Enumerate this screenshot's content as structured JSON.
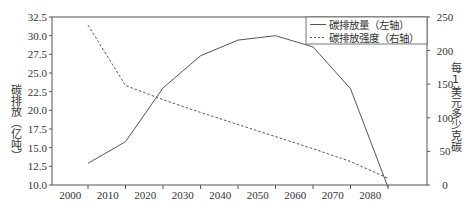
{
  "chart_data": {
    "type": "line",
    "title": "",
    "x": [
      2005,
      2015,
      2025,
      2035,
      2045,
      2055,
      2065,
      2075,
      2085
    ],
    "xlabel": "",
    "x_ticks": [
      "2000",
      "2010",
      "2020",
      "2030",
      "2040",
      "2050",
      "2060",
      "2070",
      "2080"
    ],
    "xlim": [
      1995,
      2095
    ],
    "y_left": {
      "label": "碳排放（亿吨）",
      "range": [
        10.0,
        32.5
      ],
      "ticks": [
        "10.0",
        "12.5",
        "15.0",
        "17.5",
        "20.0",
        "22.5",
        "25.0",
        "27.5",
        "30.0",
        "32.5"
      ]
    },
    "y_right": {
      "label": "每1美元多少克碳",
      "range": [
        0,
        250
      ],
      "ticks": [
        "0",
        "50",
        "100",
        "150",
        "200",
        "250"
      ]
    },
    "series": [
      {
        "name": "碳排放量（左轴）",
        "axis": "left",
        "style": "solid",
        "values": [
          12.9,
          15.8,
          23.0,
          27.3,
          29.4,
          30.0,
          28.5,
          22.9,
          9.7
        ]
      },
      {
        "name": "碳排放强度（右轴）",
        "axis": "right",
        "style": "dashed",
        "values": [
          238,
          148,
          127,
          108,
          90,
          72,
          54,
          35,
          10
        ]
      }
    ],
    "legend": {
      "position": "upper right",
      "entries": [
        "碳排放量（左轴）",
        "碳排放强度（右轴）"
      ]
    },
    "grid": false
  },
  "colors": {
    "line": "#555555",
    "axis": "#555555",
    "text": "#333333"
  }
}
